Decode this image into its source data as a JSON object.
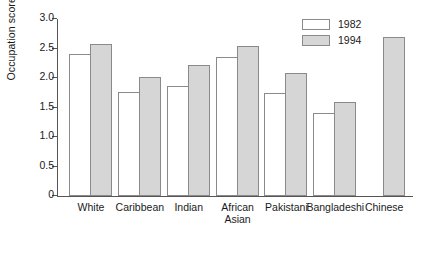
{
  "chart_data": {
    "type": "bar",
    "title": "",
    "subtitle": "",
    "xlabel": "",
    "ylabel": "Occupation score (max.=4)",
    "ylim": [
      0,
      3.0
    ],
    "ytick_labels": [
      "0",
      "0.5",
      "1.0",
      "1.5",
      "2.0",
      "2.5",
      "3.0"
    ],
    "ytick_values": [
      0,
      0.5,
      1.0,
      1.5,
      2.0,
      2.5,
      3.0
    ],
    "grid": false,
    "legend_position": "top-right",
    "categories": [
      "White",
      "Caribbean",
      "Indian",
      "African\nAsian",
      "Pakistani",
      "Bangladeshi",
      "Chinese"
    ],
    "series": [
      {
        "name": "1982",
        "color": "#ffffff",
        "values": [
          2.41,
          1.76,
          1.87,
          2.35,
          1.75,
          1.4,
          null
        ]
      },
      {
        "name": "1994",
        "color": "#d6d6d6",
        "values": [
          2.58,
          2.02,
          2.22,
          2.54,
          2.08,
          1.59,
          2.7
        ]
      }
    ]
  },
  "legend": {
    "entries": [
      {
        "label": "1982",
        "swatch": "white-swatch"
      },
      {
        "label": "1994",
        "swatch": "grey-swatch"
      }
    ]
  },
  "colors": {
    "series_1982": "#ffffff",
    "series_1994": "#d6d6d6",
    "bar_outline": "#8a8a8a",
    "axis": "#555555",
    "text": "#1a1a1a",
    "background": "#ffffff"
  }
}
